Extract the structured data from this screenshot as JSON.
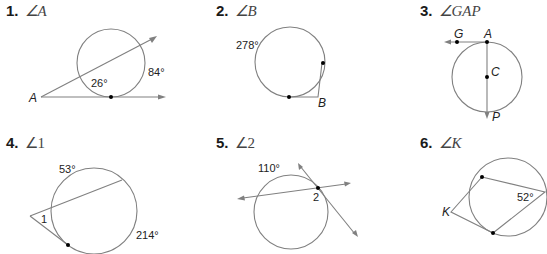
{
  "problems": [
    {
      "number": "1.",
      "angle": "∠A",
      "labels": {
        "vertex": "A",
        "arc_near": "26°",
        "arc_far": "84°"
      }
    },
    {
      "number": "2.",
      "angle": "∠B",
      "labels": {
        "vertex": "B",
        "arc_major": "278°"
      }
    },
    {
      "number": "3.",
      "angle": "∠GAP",
      "labels": {
        "G": "G",
        "A": "A",
        "C": "C",
        "P": "P"
      }
    },
    {
      "number": "4.",
      "angle": "∠1",
      "labels": {
        "angle": "1",
        "arc_near": "53°",
        "arc_far": "214°"
      }
    },
    {
      "number": "5.",
      "angle": "∠2",
      "labels": {
        "angle": "2",
        "arc": "110°"
      }
    },
    {
      "number": "6.",
      "angle": "∠K",
      "labels": {
        "vertex": "K",
        "inscribed": "52°"
      }
    }
  ]
}
